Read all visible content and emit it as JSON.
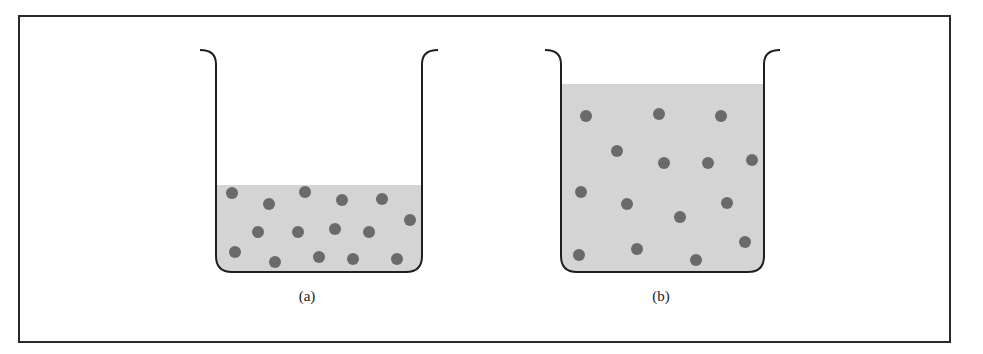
{
  "figure": {
    "panels": [
      {
        "id": "a",
        "label": "(a)",
        "description": "Beaker with low liquid level, particles crowded (concentrated solution)",
        "beaker": {
          "left": 216,
          "right": 422,
          "lip_top": 48,
          "bottom": 272
        },
        "liquid_top": 185,
        "particles": [
          [
            232,
            193
          ],
          [
            269,
            204
          ],
          [
            305,
            192
          ],
          [
            342,
            200
          ],
          [
            382,
            199
          ],
          [
            410,
            220
          ],
          [
            258,
            232
          ],
          [
            298,
            232
          ],
          [
            335,
            229
          ],
          [
            369,
            232
          ],
          [
            235,
            252
          ],
          [
            275,
            262
          ],
          [
            319,
            257
          ],
          [
            353,
            259
          ],
          [
            397,
            259
          ]
        ],
        "label_pos": [
          307,
          288
        ]
      },
      {
        "id": "b",
        "label": "(b)",
        "description": "Beaker with high liquid level, same particles spread out (dilute solution)",
        "beaker": {
          "left": 561,
          "right": 764,
          "lip_top": 48,
          "bottom": 272
        },
        "liquid_top": 84,
        "particles": [
          [
            586,
            116
          ],
          [
            659,
            114
          ],
          [
            721,
            116
          ],
          [
            617,
            151
          ],
          [
            664,
            163
          ],
          [
            708,
            163
          ],
          [
            752,
            160
          ],
          [
            581,
            192
          ],
          [
            627,
            204
          ],
          [
            680,
            217
          ],
          [
            727,
            203
          ],
          [
            579,
            255
          ],
          [
            637,
            249
          ],
          [
            696,
            260
          ],
          [
            745,
            242
          ]
        ],
        "label_pos": [
          661,
          288
        ]
      }
    ],
    "colors": {
      "liquid": "#d4d4d4",
      "particle": "#6a6a6a",
      "outline": "#1e1e1e",
      "frame": "#2a2a2a"
    },
    "particle_radius": 6
  }
}
